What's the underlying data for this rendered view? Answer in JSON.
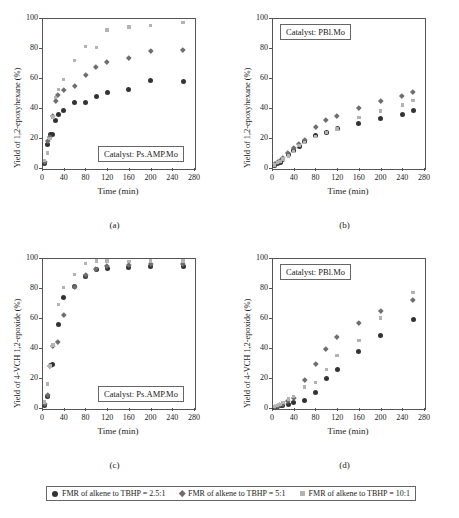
{
  "legend": {
    "items": [
      {
        "label": "FMR of alkene to TBHP = 2.5:1",
        "marker": "circle-dark",
        "color": "#333333"
      },
      {
        "label": "FMR of alkene to TBHP = 5:1",
        "marker": "diamond-gray",
        "color": "#6e6e6e"
      },
      {
        "label": "FMR of alkene to TBHP = 10:1",
        "marker": "square-light",
        "color": "#b3b3b3"
      }
    ]
  },
  "chart_data": [
    {
      "type": "scatter",
      "panel": "(a)",
      "title": "",
      "annotation": "Catalyst: Ps.AMP.Mo",
      "xlabel": "Time (min)",
      "ylabel": "Yield of 1,2-epoxyhexane (%)",
      "xlim": [
        0,
        280
      ],
      "ylim": [
        0,
        100
      ],
      "xticks": [
        0,
        40,
        80,
        120,
        160,
        200,
        240,
        280
      ],
      "yticks": [
        0,
        20,
        40,
        60,
        80,
        100
      ],
      "grid": false,
      "legend_position": "bottom-outside",
      "series": [
        {
          "name": "FMR of alkene to TBHP = 2.5:1",
          "color": "#333333",
          "marker": "circle",
          "x": [
            5,
            10,
            15,
            20,
            25,
            30,
            40,
            60,
            80,
            100,
            120,
            160,
            200,
            260
          ],
          "y": [
            3,
            16,
            22.5,
            22.5,
            32,
            35.5,
            38.5,
            44,
            44,
            47.5,
            50.5,
            52.5,
            58.5,
            58,
            61.5
          ]
        },
        {
          "name": "FMR of alkene to TBHP = 5:1",
          "color": "#6e6e6e",
          "marker": "diamond",
          "x": [
            5,
            10,
            15,
            20,
            25,
            30,
            40,
            60,
            80,
            100,
            120,
            160,
            200,
            260
          ],
          "y": [
            4,
            18,
            21,
            34.5,
            44.5,
            49,
            52,
            54.5,
            62,
            67.5,
            71,
            73.5,
            78,
            78.5,
            83
          ]
        },
        {
          "name": "FMR of alkene to TBHP = 10:1",
          "color": "#b3b3b3",
          "marker": "square",
          "x": [
            5,
            10,
            15,
            20,
            25,
            30,
            40,
            60,
            80,
            100,
            120,
            160,
            200,
            260
          ],
          "y": [
            5,
            10,
            19.5,
            34,
            47,
            52.5,
            59,
            71.5,
            81,
            80.5,
            92,
            94,
            95,
            97
          ]
        }
      ]
    },
    {
      "type": "scatter",
      "panel": "(b)",
      "title": "",
      "annotation": "Catalyst: PBl.Mo",
      "xlabel": "Time (min)",
      "ylabel": "Yield of 1,2-epoxyhexane (%)",
      "xlim": [
        0,
        280
      ],
      "ylim": [
        0,
        100
      ],
      "xticks": [
        0,
        40,
        80,
        120,
        160,
        200,
        240,
        280
      ],
      "yticks": [
        0,
        20,
        40,
        60,
        80,
        100
      ],
      "grid": false,
      "legend_position": "bottom-outside",
      "series": [
        {
          "name": "FMR of alkene to TBHP = 2.5:1",
          "color": "#333333",
          "marker": "circle",
          "x": [
            5,
            10,
            15,
            20,
            30,
            40,
            50,
            60,
            80,
            100,
            120,
            160,
            200,
            240,
            260
          ],
          "y": [
            2,
            3,
            4,
            5.5,
            9,
            12,
            14.5,
            18,
            21.5,
            24,
            26.5,
            30,
            33,
            36,
            38.5
          ]
        },
        {
          "name": "FMR of alkene to TBHP = 5:1",
          "color": "#6e6e6e",
          "marker": "diamond",
          "x": [
            5,
            10,
            15,
            20,
            30,
            40,
            50,
            60,
            80,
            100,
            120,
            160,
            200,
            240,
            260
          ],
          "y": [
            2.5,
            4,
            5,
            6.5,
            10,
            13.5,
            16,
            19,
            27.5,
            32,
            35,
            40,
            44.5,
            48,
            51
          ]
        },
        {
          "name": "FMR of alkene to TBHP = 10:1",
          "color": "#b3b3b3",
          "marker": "square",
          "x": [
            5,
            10,
            15,
            20,
            30,
            40,
            50,
            60,
            80,
            100,
            120,
            160,
            200,
            240,
            260
          ],
          "y": [
            2,
            3.5,
            4.5,
            6,
            8,
            11,
            15,
            17,
            21,
            23.5,
            26,
            33.5,
            38,
            42,
            45
          ]
        }
      ]
    },
    {
      "type": "scatter",
      "panel": "(c)",
      "title": "",
      "annotation": "Catalyst: Ps.AMP.Mo",
      "xlabel": "Time (min)",
      "ylabel": "Yield of 4-VCH 1,2-epoxide (%)",
      "xlim": [
        0,
        280
      ],
      "ylim": [
        0,
        100
      ],
      "xticks": [
        0,
        40,
        80,
        120,
        160,
        200,
        240,
        280
      ],
      "yticks": [
        0,
        20,
        40,
        60,
        80,
        100
      ],
      "grid": false,
      "legend_position": "bottom-outside",
      "series": [
        {
          "name": "FMR of alkene to TBHP = 2.5:1",
          "color": "#333333",
          "marker": "circle",
          "x": [
            5,
            10,
            15,
            20,
            30,
            40,
            60,
            80,
            100,
            120,
            160,
            200,
            260
          ],
          "y": [
            2,
            8,
            28.5,
            29,
            56,
            73.5,
            81,
            87.5,
            92.5,
            93,
            93.5,
            94.5,
            94.5,
            92.5
          ]
        },
        {
          "name": "FMR of alkene to TBHP = 5:1",
          "color": "#6e6e6e",
          "marker": "diamond",
          "x": [
            5,
            10,
            15,
            20,
            30,
            40,
            60,
            80,
            100,
            120,
            160,
            200,
            260
          ],
          "y": [
            3,
            9,
            28,
            41.5,
            44,
            62,
            81,
            89,
            93,
            95,
            95.5,
            96,
            96,
            95
          ]
        },
        {
          "name": "FMR of alkene to TBHP = 10:1",
          "color": "#b3b3b3",
          "marker": "square",
          "x": [
            5,
            10,
            15,
            20,
            30,
            40,
            60,
            80,
            100,
            120,
            160,
            200,
            260
          ],
          "y": [
            4,
            16,
            28,
            42,
            69,
            80.5,
            89,
            96.5,
            98,
            98,
            97.5,
            98,
            98,
            98
          ]
        }
      ]
    },
    {
      "type": "scatter",
      "panel": "(d)",
      "title": "",
      "annotation": "Catalyst: PBl.Mo",
      "xlabel": "Time (min)",
      "ylabel": "Yield of 4-VCH 1,2-epoxide (%)",
      "xlim": [
        0,
        280
      ],
      "ylim": [
        0,
        100
      ],
      "xticks": [
        0,
        40,
        80,
        120,
        160,
        200,
        240,
        280
      ],
      "yticks": [
        0,
        20,
        40,
        60,
        80,
        100
      ],
      "grid": false,
      "legend_position": "bottom-outside",
      "series": [
        {
          "name": "FMR of alkene to TBHP = 2.5:1",
          "color": "#333333",
          "marker": "circle",
          "x": [
            5,
            10,
            15,
            20,
            30,
            40,
            60,
            80,
            100,
            120,
            160,
            200,
            260
          ],
          "y": [
            0.5,
            1,
            1.5,
            2,
            2.5,
            3.5,
            5,
            10.5,
            20,
            26,
            37.5,
            48.5,
            59
          ]
        },
        {
          "name": "FMR of alkene to TBHP = 5:1",
          "color": "#6e6e6e",
          "marker": "diamond",
          "x": [
            5,
            10,
            15,
            20,
            30,
            40,
            60,
            80,
            100,
            120,
            160,
            200,
            260
          ],
          "y": [
            1,
            1.5,
            2,
            3,
            5,
            6.5,
            19,
            29.5,
            39.5,
            47.5,
            57,
            65,
            72
          ]
        },
        {
          "name": "FMR of alkene to TBHP = 10:1",
          "color": "#b3b3b3",
          "marker": "square",
          "x": [
            5,
            10,
            15,
            20,
            30,
            40,
            60,
            80,
            100,
            120,
            160,
            200,
            260
          ],
          "y": [
            1,
            1.5,
            2.5,
            3.5,
            6,
            7.5,
            14,
            17,
            25.5,
            35,
            45,
            60,
            77
          ]
        }
      ]
    }
  ]
}
